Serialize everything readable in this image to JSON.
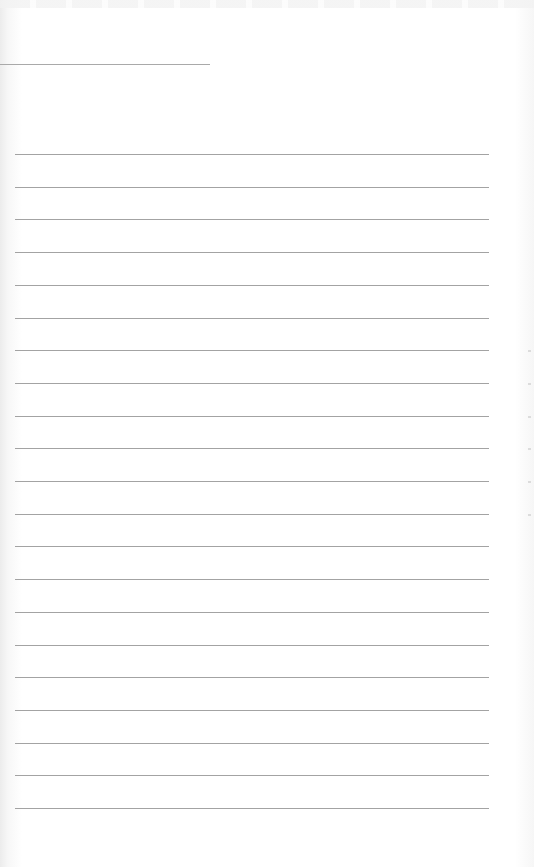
{
  "document": {
    "type": "lined paper sheet",
    "background_color": "#ffffff",
    "line_color": "#a3a3a3",
    "header_line": {
      "y": 64,
      "x_start": 0,
      "x_end": 210
    },
    "ruled_lines": {
      "count": 21,
      "first_y": 154,
      "spacing": 32.7,
      "x_start": 15,
      "x_end": 489
    },
    "text_content": ""
  }
}
